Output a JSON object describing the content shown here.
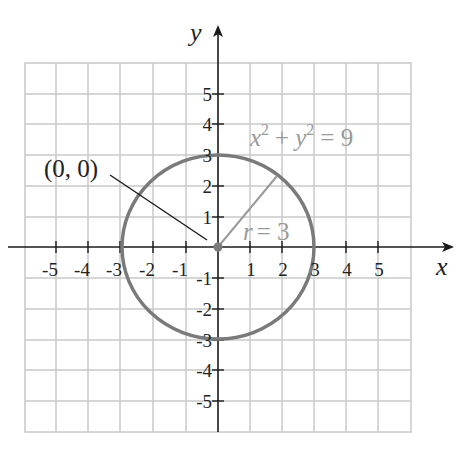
{
  "diagram": {
    "type": "coordinate-plane-circle",
    "axes": {
      "x_label": "x",
      "y_label": "y",
      "x_ticks": [
        "-5",
        "-4",
        "-3",
        "-2",
        "-1",
        "1",
        "2",
        "3",
        "4",
        "5"
      ],
      "y_ticks": [
        "5",
        "4",
        "3",
        "2",
        "1",
        "-1",
        "-2",
        "-3",
        "-4",
        "-5"
      ],
      "range": [
        -6,
        6
      ]
    },
    "circle": {
      "equation_lhs_x": "x",
      "equation_sup_x": "2",
      "equation_plus": "+",
      "equation_lhs_y": "y",
      "equation_sup_y": "2",
      "equation_rhs": "= 9",
      "center": [
        0,
        0
      ],
      "radius": 3
    },
    "center_label": "(0, 0)",
    "radius_label_var": "r",
    "radius_label_value": "= 3",
    "colors": {
      "grid": "#c8c8c8",
      "axis": "#1a1a1a",
      "circle": "#7a7a7a",
      "radius_line": "#9a9a9a",
      "label_gray": "#9a9a9a",
      "text": "#222222"
    }
  }
}
